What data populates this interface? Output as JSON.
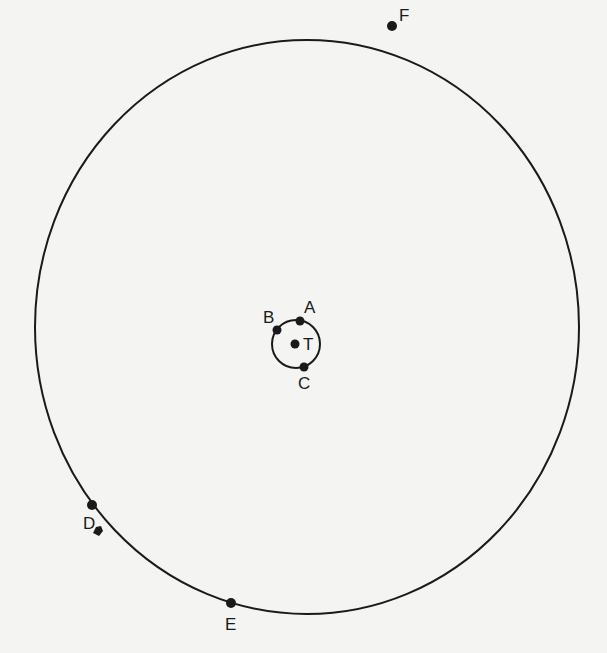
{
  "diagram": {
    "type": "orbit-positions",
    "background_color": "#f4f4f3",
    "stroke_color": "#1a1a1a",
    "outer_orbit": {
      "center": [
        307,
        327
      ],
      "rx": 272,
      "ry": 287
    },
    "inner_orbit": {
      "center": [
        296,
        344
      ],
      "r": 24
    },
    "center_body": {
      "label": "T",
      "position": [
        295,
        344
      ],
      "label_position": [
        303,
        350
      ]
    },
    "inner_points": [
      {
        "label": "A",
        "position": [
          300,
          321
        ],
        "label_position": [
          304,
          313
        ]
      },
      {
        "label": "B",
        "position": [
          277,
          330
        ],
        "label_position": [
          263,
          323
        ]
      },
      {
        "label": "C",
        "position": [
          304,
          367
        ],
        "label_position": [
          298,
          389
        ]
      }
    ],
    "outer_points": [
      {
        "label": "F",
        "position": [
          392,
          26
        ],
        "label_position": [
          399,
          21
        ]
      },
      {
        "label": "D",
        "position": [
          92,
          505
        ],
        "label_position": [
          83,
          529
        ]
      },
      {
        "label": "E",
        "position": [
          231,
          603
        ],
        "label_position": [
          225,
          630
        ]
      }
    ],
    "marker_near_D": {
      "shape": "blob",
      "position": [
        98,
        531
      ]
    }
  }
}
